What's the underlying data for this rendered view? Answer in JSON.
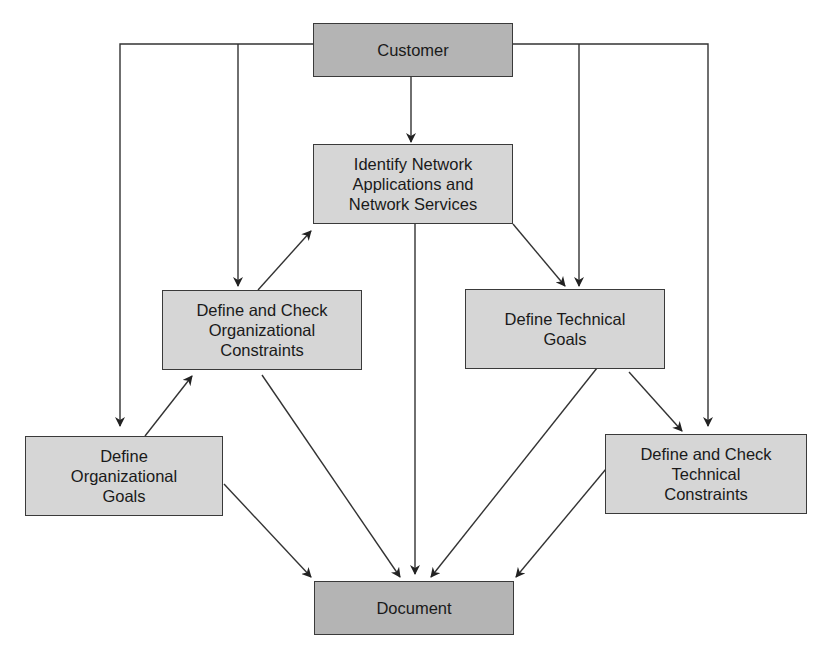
{
  "diagram": {
    "type": "flowchart",
    "colors": {
      "primary_box_fill": "#b4b4b4",
      "secondary_box_fill": "#d6d6d6",
      "stroke": "#333333"
    },
    "nodes": {
      "customer": {
        "label": "Customer",
        "style": "dark"
      },
      "identify": {
        "label": "Identify Network\nApplications and\nNetwork Services",
        "style": "light"
      },
      "org_constraints": {
        "label": "Define and Check\nOrganizational\nConstraints",
        "style": "light"
      },
      "tech_goals": {
        "label": "Define Technical\nGoals",
        "style": "light"
      },
      "org_goals": {
        "label": "Define\nOrganizational\nGoals",
        "style": "light"
      },
      "tech_constraints": {
        "label": "Define and Check\nTechnical\nConstraints",
        "style": "light"
      },
      "document": {
        "label": "Document",
        "style": "dark"
      }
    },
    "edges": [
      {
        "from": "customer",
        "to": "identify"
      },
      {
        "from": "customer",
        "to": "org_constraints"
      },
      {
        "from": "customer",
        "to": "org_goals"
      },
      {
        "from": "customer",
        "to": "tech_goals"
      },
      {
        "from": "customer",
        "to": "tech_constraints"
      },
      {
        "from": "org_goals",
        "to": "org_constraints"
      },
      {
        "from": "org_constraints",
        "to": "identify"
      },
      {
        "from": "identify",
        "to": "tech_goals"
      },
      {
        "from": "tech_goals",
        "to": "tech_constraints"
      },
      {
        "from": "identify",
        "to": "document"
      },
      {
        "from": "org_goals",
        "to": "document"
      },
      {
        "from": "org_constraints",
        "to": "document"
      },
      {
        "from": "tech_goals",
        "to": "document"
      },
      {
        "from": "tech_constraints",
        "to": "document"
      }
    ]
  }
}
